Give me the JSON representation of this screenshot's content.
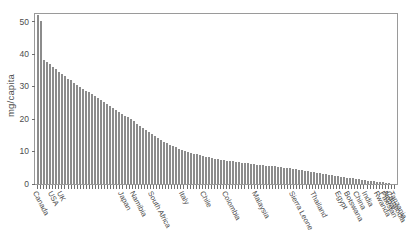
{
  "chart_data": {
    "type": "bar",
    "title": "",
    "subtitle": "",
    "xlabel": "",
    "ylabel": "mg/capita",
    "ylim": [
      0,
      53
    ],
    "yticks": [
      0,
      10,
      20,
      30,
      40,
      50
    ],
    "grid": false,
    "legend": null,
    "bar_color": "#8c8c8c",
    "axis_color": "#9a9a9a",
    "text_color": "#4d4d4d",
    "note": "Single-series descending (rank-ordered) bar chart of per-capita consumption in mg/capita across ~118 countries; long exponential tail toward zero.",
    "labeled_categories": [
      {
        "index": 0,
        "label": "Canada"
      },
      {
        "index": 5,
        "label": "USA"
      },
      {
        "index": 8,
        "label": "UK"
      },
      {
        "index": 28,
        "label": "Japan"
      },
      {
        "index": 32,
        "label": "Namibia"
      },
      {
        "index": 38,
        "label": "South Africa"
      },
      {
        "index": 48,
        "label": "Italy"
      },
      {
        "index": 55,
        "label": "Chile"
      },
      {
        "index": 62,
        "label": "Colombia"
      },
      {
        "index": 72,
        "label": "Malaysia"
      },
      {
        "index": 84,
        "label": "Sierra Leone"
      },
      {
        "index": 91,
        "label": "Thailand"
      },
      {
        "index": 99,
        "label": "Egypt"
      },
      {
        "index": 102,
        "label": "Botswana"
      },
      {
        "index": 105,
        "label": "China"
      },
      {
        "index": 108,
        "label": "India"
      },
      {
        "index": 112,
        "label": "Rwanda"
      },
      {
        "index": 114,
        "label": "Pakistan"
      },
      {
        "index": 115,
        "label": "Nepal"
      },
      {
        "index": 116,
        "label": "Cambodia"
      },
      {
        "index": 117,
        "label": "Tanzania"
      }
    ],
    "values": [
      52.0,
      50.2,
      38.2,
      37.6,
      36.9,
      36.2,
      35.4,
      34.6,
      33.9,
      33.2,
      32.5,
      31.9,
      31.2,
      30.6,
      30.0,
      29.4,
      28.8,
      28.2,
      27.6,
      27.0,
      26.4,
      25.9,
      25.3,
      24.7,
      24.1,
      23.5,
      22.9,
      22.3,
      21.7,
      21.1,
      20.5,
      19.9,
      19.3,
      18.6,
      18.0,
      17.3,
      16.7,
      16.0,
      15.4,
      14.8,
      14.2,
      13.6,
      13.1,
      12.6,
      12.1,
      11.7,
      11.3,
      10.9,
      10.5,
      10.2,
      9.9,
      9.6,
      9.3,
      9.1,
      8.8,
      8.6,
      8.4,
      8.2,
      8.0,
      7.8,
      7.7,
      7.5,
      7.4,
      7.2,
      7.1,
      7.0,
      6.8,
      6.7,
      6.6,
      6.5,
      6.4,
      6.3,
      6.2,
      6.0,
      5.9,
      5.8,
      5.7,
      5.6,
      5.5,
      5.4,
      5.3,
      5.1,
      5.0,
      4.9,
      4.8,
      4.6,
      4.5,
      4.4,
      4.2,
      4.1,
      3.9,
      3.8,
      3.6,
      3.5,
      3.3,
      3.2,
      3.0,
      2.9,
      2.7,
      2.6,
      2.4,
      2.3,
      2.1,
      2.0,
      1.8,
      1.7,
      1.6,
      1.4,
      1.3,
      1.2,
      1.0,
      0.9,
      0.8,
      0.7,
      0.6,
      0.5,
      0.4,
      0.3
    ]
  }
}
